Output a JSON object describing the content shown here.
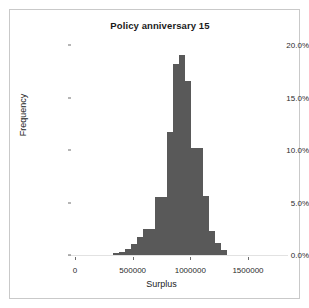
{
  "figure": {
    "background_color": "#ffffff",
    "frame_color": "#c9c9c9",
    "bar_color": "#595959"
  },
  "chart_data": {
    "type": "bar",
    "chart_subtype": "histogram",
    "title": "Policy anniversary 15",
    "xlabel": "Surplus",
    "ylabel": "Frequency",
    "xlim": [
      0,
      1560000
    ],
    "ylim": [
      0,
      21.0
    ],
    "grid": false,
    "legend": null,
    "xtick_labels": [
      "0",
      "500000",
      "1000000",
      "1500000"
    ],
    "xtick_values": [
      0,
      500000,
      1000000,
      1500000
    ],
    "ytick_labels": [
      "0.0%",
      "5.0%",
      "10.0%",
      "15.0%",
      "20.0%"
    ],
    "ytick_values": [
      0,
      5,
      10,
      15,
      20
    ],
    "bin_width": 52000,
    "categories": [
      "330000",
      "382000",
      "434000",
      "486000",
      "538000",
      "590000",
      "642000",
      "694000",
      "746000",
      "798000",
      "850000",
      "902000",
      "954000",
      "1006000",
      "1058000",
      "1110000",
      "1162000",
      "1214000",
      "1266000"
    ],
    "bin_starts": [
      330000,
      382000,
      434000,
      486000,
      538000,
      590000,
      642000,
      694000,
      746000,
      798000,
      850000,
      902000,
      954000,
      1006000,
      1058000,
      1110000,
      1162000,
      1214000,
      1266000
    ],
    "values": [
      0.2,
      0.3,
      0.6,
      1.1,
      1.8,
      2.6,
      2.6,
      5.8,
      5.8,
      12.3,
      19.1,
      20.0,
      17.4,
      10.7,
      10.7,
      5.9,
      2.4,
      1.2,
      0.5
    ],
    "units": "percent"
  }
}
